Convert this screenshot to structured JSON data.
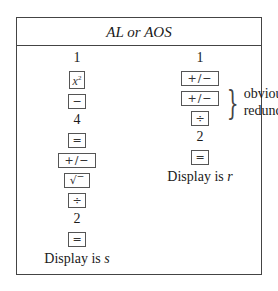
{
  "header": {
    "title": "AL or AOS"
  },
  "left_column": {
    "steps": [
      {
        "type": "number",
        "text": "1"
      },
      {
        "type": "key",
        "text": "x",
        "sup": "2",
        "icon": "x-squared-key"
      },
      {
        "type": "key",
        "text": "−",
        "icon": "minus-key"
      },
      {
        "type": "number",
        "text": "4"
      },
      {
        "type": "key",
        "text": "=",
        "icon": "equals-key"
      },
      {
        "type": "key",
        "text": "+/−",
        "icon": "change-sign-key"
      },
      {
        "type": "key",
        "text": "√‾",
        "icon": "square-root-key"
      },
      {
        "type": "key",
        "text": "÷",
        "icon": "divide-key"
      },
      {
        "type": "number",
        "text": "2"
      },
      {
        "type": "key",
        "text": "=",
        "icon": "equals-key"
      }
    ],
    "display_prefix": "Display is ",
    "display_var": "s"
  },
  "right_column": {
    "steps": [
      {
        "type": "number",
        "text": "1"
      },
      {
        "type": "key",
        "text": "+/−",
        "icon": "change-sign-key"
      },
      {
        "type": "key",
        "text": "+/−",
        "icon": "change-sign-key"
      },
      {
        "type": "key",
        "text": "÷",
        "icon": "divide-key"
      },
      {
        "type": "number",
        "text": "2"
      },
      {
        "type": "key",
        "text": "=",
        "icon": "equals-key"
      }
    ],
    "annotation": {
      "line1": "obviously",
      "line2": "redundant",
      "brace": "}"
    },
    "display_prefix": "Display is ",
    "display_var": "r"
  }
}
